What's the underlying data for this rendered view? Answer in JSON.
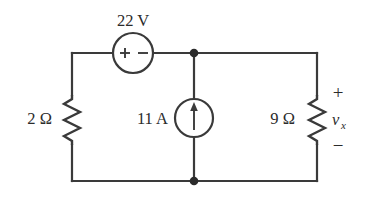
{
  "figure": {
    "kind": "circuit-schematic",
    "title": "",
    "background_color": "#ffffff",
    "line_color": "#3a3a3a",
    "text_color": "#2b2b2b"
  },
  "components": {
    "voltage_source": {
      "label": "22 V",
      "symbol_plus": "+",
      "symbol_minus": "−",
      "shape": "circle",
      "position": "top-branch"
    },
    "current_source": {
      "label": "11 A",
      "shape": "circle",
      "arrow_direction": "up",
      "position": "middle-branch"
    },
    "resistor_left": {
      "label": "2 Ω",
      "value": "2",
      "unit": "Ω",
      "position": "left-branch"
    },
    "resistor_right": {
      "label": "9 Ω",
      "value": "9",
      "unit": "Ω",
      "position": "right-branch"
    }
  },
  "annotations": {
    "vx_label": "v",
    "vx_subscript": "x",
    "vx_plus": "+",
    "vx_minus": "−"
  },
  "nodes": {
    "top_node_label": "",
    "bottom_node_label": ""
  }
}
